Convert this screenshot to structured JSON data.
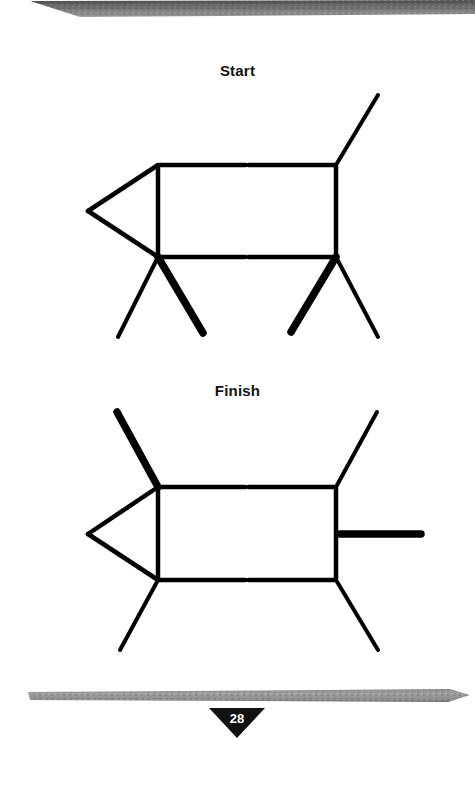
{
  "page": {
    "number": "28",
    "background_color": "#ffffff",
    "width": 475,
    "height": 786
  },
  "banners": {
    "color_dark": "#6f6f6f",
    "color_light": "#a9a9a9",
    "top": {
      "name": "top-decorative-bar"
    },
    "bottom": {
      "name": "bottom-decorative-bar"
    }
  },
  "sections": [
    {
      "label": "Start",
      "name": "start"
    },
    {
      "label": "Finish",
      "name": "finish"
    }
  ],
  "labels": {
    "start": "Start",
    "finish": "Finish"
  },
  "colors": {
    "stick": "#000000",
    "highlight_stick": "#000000",
    "page_plate": "#111111",
    "page_number_text": "#ffffff"
  },
  "puzzle": {
    "type": "matchstick-puzzle",
    "start_figure": {
      "name": "start-matchstick-animal",
      "description": "Matchstick animal: rectangular body, triangular head at left, tail at upper right, four legs. Two legs drawn thick.",
      "sticks": [
        {
          "id": "head-upper",
          "x1": 88,
          "y1": 211,
          "x2": 158,
          "y2": 165,
          "thick": false
        },
        {
          "id": "head-lower",
          "x1": 88,
          "y1": 211,
          "x2": 158,
          "y2": 257,
          "thick": false
        },
        {
          "id": "body-top-left",
          "x1": 158,
          "y1": 165,
          "x2": 247,
          "y2": 165,
          "thick": false
        },
        {
          "id": "body-top-right",
          "x1": 247,
          "y1": 165,
          "x2": 336,
          "y2": 165,
          "thick": false
        },
        {
          "id": "body-bottom-left",
          "x1": 158,
          "y1": 257,
          "x2": 247,
          "y2": 257,
          "thick": false
        },
        {
          "id": "body-bottom-right",
          "x1": 247,
          "y1": 257,
          "x2": 336,
          "y2": 257,
          "thick": false
        },
        {
          "id": "body-left-side",
          "x1": 158,
          "y1": 165,
          "x2": 158,
          "y2": 257,
          "thick": false
        },
        {
          "id": "body-right-side",
          "x1": 336,
          "y1": 165,
          "x2": 336,
          "y2": 257,
          "thick": false
        },
        {
          "id": "tail",
          "x1": 336,
          "y1": 165,
          "x2": 378,
          "y2": 95,
          "thick": false
        },
        {
          "id": "front-leg-left",
          "x1": 158,
          "y1": 257,
          "x2": 118,
          "y2": 337,
          "thick": false
        },
        {
          "id": "front-leg-right",
          "x1": 158,
          "y1": 257,
          "x2": 203,
          "y2": 333,
          "thick": true
        },
        {
          "id": "rear-leg-left",
          "x1": 336,
          "y1": 257,
          "x2": 291,
          "y2": 332,
          "thick": true
        },
        {
          "id": "rear-leg-right",
          "x1": 336,
          "y1": 257,
          "x2": 378,
          "y2": 337,
          "thick": false
        }
      ]
    },
    "finish_figure": {
      "name": "finish-matchstick-animal",
      "description": "Matchstick animal after moving two sticks: one thick stick now points up-left from the top-left corner, the other thick stick is horizontal off the right side. Only two thin legs remain.",
      "sticks": [
        {
          "id": "horn",
          "x1": 117,
          "y1": 412,
          "x2": 158,
          "y2": 487,
          "thick": true
        },
        {
          "id": "head-upper",
          "x1": 88,
          "y1": 534,
          "x2": 158,
          "y2": 487,
          "thick": false
        },
        {
          "id": "head-lower",
          "x1": 88,
          "y1": 534,
          "x2": 158,
          "y2": 580,
          "thick": false
        },
        {
          "id": "body-top-left",
          "x1": 158,
          "y1": 487,
          "x2": 247,
          "y2": 487,
          "thick": false
        },
        {
          "id": "body-top-right",
          "x1": 247,
          "y1": 487,
          "x2": 336,
          "y2": 487,
          "thick": false
        },
        {
          "id": "body-bottom-left",
          "x1": 158,
          "y1": 580,
          "x2": 247,
          "y2": 580,
          "thick": false
        },
        {
          "id": "body-bottom-right",
          "x1": 247,
          "y1": 580,
          "x2": 336,
          "y2": 580,
          "thick": false
        },
        {
          "id": "body-left-side",
          "x1": 158,
          "y1": 487,
          "x2": 158,
          "y2": 580,
          "thick": false
        },
        {
          "id": "body-right-side",
          "x1": 336,
          "y1": 487,
          "x2": 336,
          "y2": 580,
          "thick": false
        },
        {
          "id": "tail",
          "x1": 336,
          "y1": 487,
          "x2": 377,
          "y2": 412,
          "thick": false
        },
        {
          "id": "spike-right",
          "x1": 340,
          "y1": 534,
          "x2": 421,
          "y2": 534,
          "thick": true
        },
        {
          "id": "front-leg-left",
          "x1": 158,
          "y1": 580,
          "x2": 120,
          "y2": 650,
          "thick": false
        },
        {
          "id": "rear-leg-right",
          "x1": 336,
          "y1": 580,
          "x2": 378,
          "y2": 650,
          "thick": false
        }
      ]
    }
  }
}
